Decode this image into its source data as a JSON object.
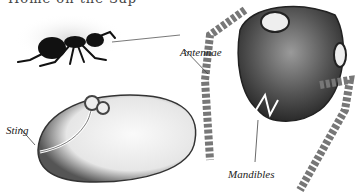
{
  "figure": {
    "top_text_cropped": "Home on the Sap",
    "labels": {
      "antennae": "Antennae",
      "sting": "Sting",
      "mandibles": "Mandibles"
    }
  }
}
